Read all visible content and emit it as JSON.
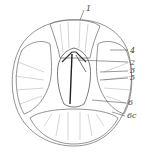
{
  "diagram": {
    "labels": [
      {
        "id": "1",
        "text": "1",
        "x": 86,
        "y": 5
      },
      {
        "id": "4",
        "text": "4",
        "x": 130,
        "y": 47
      },
      {
        "id": "2",
        "text": "2",
        "x": 130,
        "y": 59
      },
      {
        "id": "3",
        "text": "3",
        "x": 130,
        "y": 68
      },
      {
        "id": "5",
        "text": "5",
        "x": 130,
        "y": 75
      },
      {
        "id": "6",
        "text": "6",
        "x": 128,
        "y": 100
      },
      {
        "id": "6c",
        "text": "6c",
        "x": 127,
        "y": 113
      }
    ]
  }
}
